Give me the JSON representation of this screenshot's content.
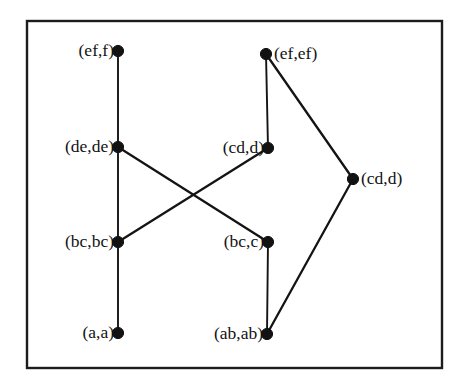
{
  "figure": {
    "frame": {
      "x": 27,
      "y": 21,
      "width": 415,
      "height": 347,
      "stroke_color": "#1c1c1c"
    },
    "background_color": "#ffffff",
    "ink_color": "#131313"
  },
  "chart_data": {
    "type": "diagram",
    "subtype": "hasse-diagram",
    "title": "",
    "xlabel": "",
    "ylabel": "",
    "node_color": "#121212",
    "edge_color": "#141414",
    "nodes": [
      {
        "id": "ef_f",
        "label": "(ef,f)",
        "x": 118,
        "y": 51,
        "label_side": "left"
      },
      {
        "id": "ef_ef",
        "label": "(ef,ef)",
        "x": 266,
        "y": 54,
        "label_side": "right"
      },
      {
        "id": "de_de",
        "label": "(de,de)",
        "x": 118,
        "y": 147,
        "label_side": "left"
      },
      {
        "id": "cd_d_m",
        "label": "(cd,d)",
        "x": 268,
        "y": 148,
        "label_side": "left"
      },
      {
        "id": "cd_d_r",
        "label": "(cd,d)",
        "x": 353,
        "y": 179,
        "label_side": "right"
      },
      {
        "id": "bc_bc",
        "label": "(bc,bc)",
        "x": 118,
        "y": 242,
        "label_side": "left"
      },
      {
        "id": "bc_c",
        "label": "(bc,c)",
        "x": 268,
        "y": 242,
        "label_side": "left"
      },
      {
        "id": "a_a",
        "label": "(a,a)",
        "x": 118,
        "y": 333,
        "label_side": "left"
      },
      {
        "id": "ab_ab",
        "label": "(ab,ab)",
        "x": 267,
        "y": 334,
        "label_side": "left"
      }
    ],
    "edges": [
      {
        "from": "ef_f",
        "to": "de_de",
        "style": "thin"
      },
      {
        "from": "de_de",
        "to": "bc_bc",
        "style": "thin"
      },
      {
        "from": "bc_bc",
        "to": "a_a",
        "style": "thin"
      },
      {
        "from": "de_de",
        "to": "bc_c",
        "style": "solid"
      },
      {
        "from": "bc_bc",
        "to": "cd_d_m",
        "style": "solid"
      },
      {
        "from": "ef_ef",
        "to": "cd_d_m",
        "style": "thin"
      },
      {
        "from": "ef_ef",
        "to": "cd_d_r",
        "style": "solid"
      },
      {
        "from": "cd_d_r",
        "to": "ab_ab",
        "style": "solid"
      },
      {
        "from": "bc_c",
        "to": "ab_ab",
        "style": "thin"
      }
    ]
  }
}
